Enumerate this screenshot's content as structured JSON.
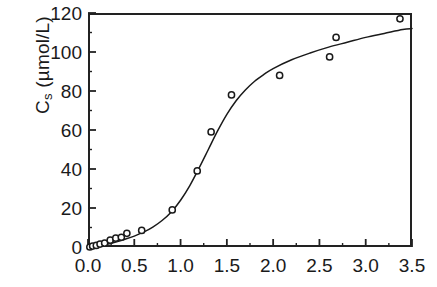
{
  "figure": {
    "kind": "scatter-with-fitted-curve",
    "background_color": "#ffffff",
    "ink_color": "#1a1a1a"
  },
  "axes": {
    "y_label_main": "C",
    "y_label_sub": "s",
    "y_label_units": " (µmol/L)",
    "y_label_full": "C_s (µmol/L)",
    "x_label": "",
    "y_ticks": [
      "0",
      "20",
      "40",
      "60",
      "80",
      "100",
      "120"
    ],
    "x_ticks": [
      "0.0",
      "0.5",
      "1.0",
      "1.5",
      "2.0",
      "2.5",
      "3.0",
      "3.5"
    ]
  },
  "chart_data": {
    "type": "scatter",
    "title": "",
    "xlabel": "",
    "ylabel": "C_s (µmol/L)",
    "xlim": [
      0.0,
      3.5
    ],
    "ylim": [
      0,
      120
    ],
    "xtick_values": [
      0.0,
      0.5,
      1.0,
      1.5,
      2.0,
      2.5,
      3.0,
      3.5
    ],
    "ytick_values": [
      0,
      20,
      40,
      60,
      80,
      100,
      120
    ],
    "x_minor_tick_step": 0.25,
    "y_minor_tick_step": 10,
    "grid": false,
    "legend": null,
    "marker": "open-circle",
    "series": [
      {
        "name": "measured",
        "kind": "scatter",
        "marker": "open-circle",
        "points": [
          [
            0.02,
            0.0
          ],
          [
            0.05,
            0.5
          ],
          [
            0.09,
            0.8
          ],
          [
            0.13,
            1.5
          ],
          [
            0.18,
            2.0
          ],
          [
            0.24,
            3.5
          ],
          [
            0.3,
            4.5
          ],
          [
            0.36,
            5.0
          ],
          [
            0.42,
            7.0
          ],
          [
            0.58,
            8.5
          ],
          [
            0.91,
            19.0
          ],
          [
            1.18,
            39.0
          ],
          [
            1.33,
            59.0
          ],
          [
            1.55,
            78.0
          ],
          [
            2.07,
            88.0
          ],
          [
            2.61,
            97.5
          ],
          [
            2.68,
            107.5
          ],
          [
            3.37,
            117.0
          ]
        ]
      },
      {
        "name": "fitted sigmoid curve",
        "kind": "line",
        "points": [
          [
            0.0,
            0.0
          ],
          [
            0.1,
            0.6
          ],
          [
            0.2,
            1.4
          ],
          [
            0.3,
            2.6
          ],
          [
            0.4,
            4.0
          ],
          [
            0.5,
            5.6
          ],
          [
            0.6,
            7.6
          ],
          [
            0.7,
            10.2
          ],
          [
            0.8,
            13.6
          ],
          [
            0.9,
            18.0
          ],
          [
            1.0,
            24.0
          ],
          [
            1.1,
            31.5
          ],
          [
            1.2,
            40.5
          ],
          [
            1.3,
            50.0
          ],
          [
            1.4,
            59.5
          ],
          [
            1.5,
            68.0
          ],
          [
            1.6,
            75.0
          ],
          [
            1.7,
            80.5
          ],
          [
            1.8,
            85.0
          ],
          [
            1.9,
            88.5
          ],
          [
            2.0,
            91.5
          ],
          [
            2.2,
            96.0
          ],
          [
            2.4,
            99.5
          ],
          [
            2.6,
            102.5
          ],
          [
            2.8,
            105.0
          ],
          [
            3.0,
            107.5
          ],
          [
            3.2,
            109.5
          ],
          [
            3.4,
            111.5
          ],
          [
            3.5,
            112.0
          ]
        ]
      }
    ]
  }
}
